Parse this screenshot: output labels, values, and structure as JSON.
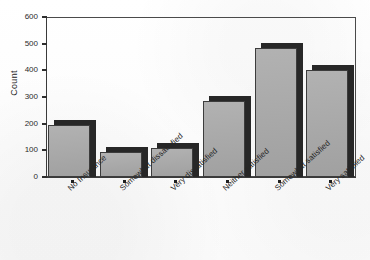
{
  "chart_data": {
    "type": "bar",
    "title": "",
    "xlabel": "",
    "ylabel": "Count",
    "ylim": [
      0,
      600
    ],
    "yticks": [
      0,
      100,
      200,
      300,
      400,
      500,
      600
    ],
    "grid": false,
    "legend": "none",
    "style": "3d-shadow-bars",
    "categories": [
      "No Insurance",
      "Somewhat dissatisfied",
      "Very dissatisfied",
      "Neither satisfied",
      "Somewhat satisfied",
      "Very satisfied"
    ],
    "values": [
      195,
      95,
      110,
      285,
      485,
      400
    ],
    "colors": {
      "bar_fill": "#a9a9a9",
      "bar_shadow": "#272727",
      "bar_outline": "#3c3c3c",
      "axis": "#3a3a3a",
      "text": "#262626",
      "background": "#fdfdfd"
    }
  },
  "axis": {
    "y_title": "Count",
    "y_tick_labels": [
      "600",
      "500",
      "400",
      "300",
      "200",
      "100",
      "0"
    ]
  },
  "title": {
    "text": ""
  }
}
